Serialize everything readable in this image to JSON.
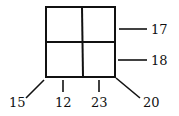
{
  "diagram": {
    "type": "grid-with-labels",
    "grid": {
      "rows": 2,
      "cols": 2
    },
    "labels": {
      "right_top": "17",
      "right_bottom": "18",
      "bottom_left_corner": "15",
      "bottom_left_cell": "12",
      "bottom_right_cell": "23",
      "bottom_right_corner": "20"
    },
    "colors": {
      "stroke": "#111111",
      "background": "#ffffff"
    }
  }
}
